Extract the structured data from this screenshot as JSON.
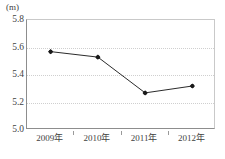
{
  "chart_data": {
    "type": "line",
    "title": "",
    "subtitle": "",
    "xlabel": "",
    "ylabel": "",
    "unit_label": "(m)",
    "categories": [
      "2009年",
      "2010年",
      "2011年",
      "2012年"
    ],
    "values": [
      5.57,
      5.53,
      5.27,
      5.32
    ],
    "series": [
      {
        "name": "",
        "values": [
          5.57,
          5.53,
          5.27,
          5.32
        ]
      }
    ],
    "ylim": [
      5.0,
      5.8
    ],
    "ytick_labels": [
      "5.8",
      "5.6",
      "5.4",
      "5.2",
      "5.0"
    ],
    "ytick_values": [
      5.8,
      5.6,
      5.4,
      5.2,
      5.0
    ],
    "grid": true,
    "grid_axis": "y",
    "legend": false,
    "legend_position": "none",
    "marker": "filled-diamond",
    "line_color": "#2b2b2b",
    "marker_color": "#1a1a1a",
    "grid_color": "#cfcfcf",
    "axis_color": "#8d8d8d",
    "background_color": "#ffffff"
  }
}
